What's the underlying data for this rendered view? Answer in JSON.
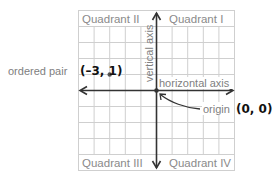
{
  "diagram": {
    "type": "coordinate-plane",
    "grid": {
      "columns": 10,
      "rows": 10,
      "x_range": [
        -5,
        5
      ],
      "y_range": [
        -5,
        5
      ]
    },
    "quadrants": {
      "q1": "Quadrant I",
      "q2": "Quadrant II",
      "q3": "Quadrant III",
      "q4": "Quadrant IV"
    },
    "axes": {
      "vertical_label": "vertical axis",
      "horizontal_label": "horizontal axis"
    },
    "ordered_pair": {
      "label": "ordered pair",
      "value": "(–3, 1)",
      "x": -3,
      "y": 1
    },
    "origin": {
      "label": "origin",
      "value": "(0, 0)"
    },
    "colors": {
      "grid": "#c8c8c8",
      "axis": "#333333",
      "label_gray": "#808080",
      "point": "#555555"
    }
  }
}
